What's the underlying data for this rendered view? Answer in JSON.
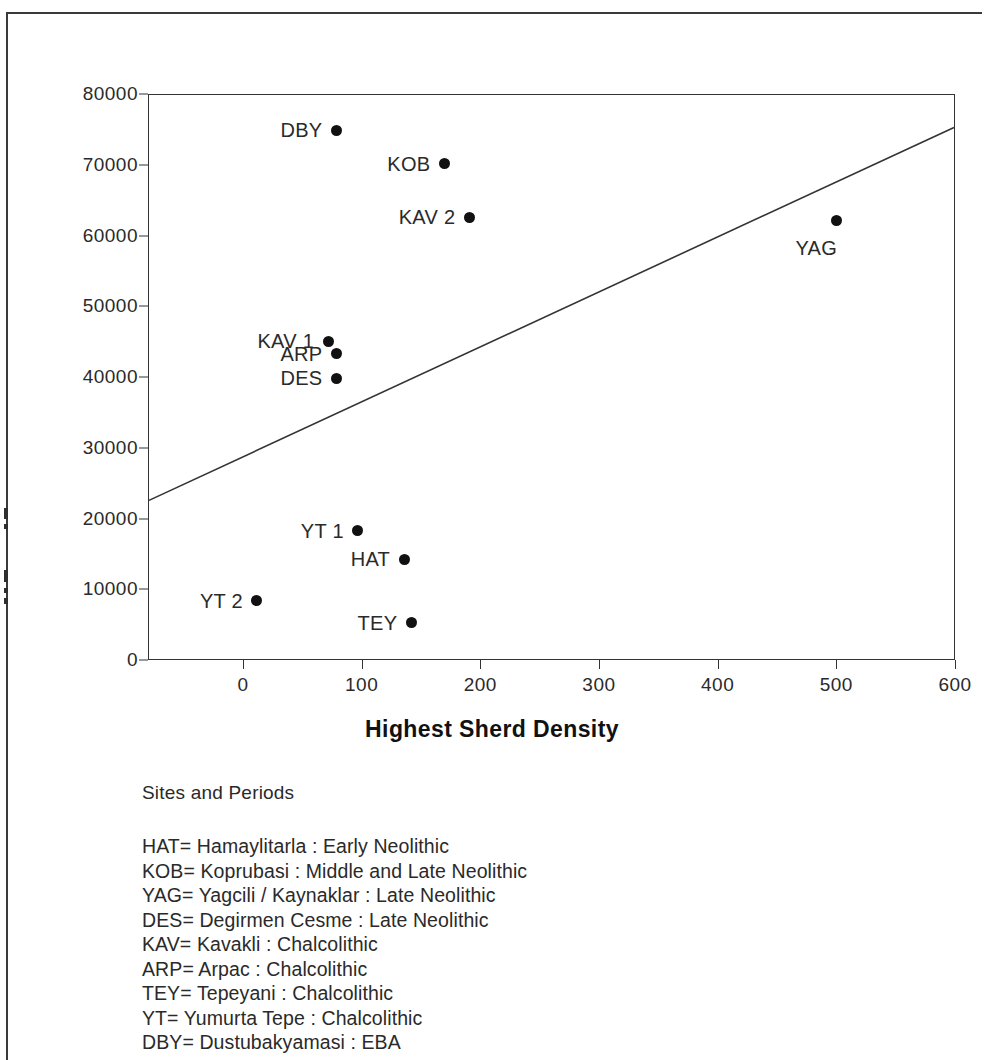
{
  "chart_data": {
    "type": "scatter",
    "title": "",
    "xlabel": "Highest Sherd Density",
    "ylabel": "",
    "xlim": [
      -80,
      600
    ],
    "ylim": [
      0,
      80000
    ],
    "grid": false,
    "legend_position": "below-plot",
    "x_ticks": [
      0,
      100,
      200,
      300,
      400,
      500,
      600
    ],
    "x_tick_labels": [
      "0",
      "100",
      "200",
      "300",
      "400",
      "500",
      "600"
    ],
    "y_ticks": [
      0,
      10000,
      20000,
      30000,
      40000,
      50000,
      60000,
      70000,
      80000
    ],
    "y_tick_labels": [
      "0",
      "10000",
      "20000",
      "30000",
      "40000",
      "50000",
      "60000",
      "70000",
      "80000"
    ],
    "points": [
      {
        "label": "DBY",
        "x": 78,
        "y": 75000,
        "label_side": "left"
      },
      {
        "label": "KOB",
        "x": 169,
        "y": 70250,
        "label_side": "left"
      },
      {
        "label": "KAV 2",
        "x": 190,
        "y": 62750,
        "label_side": "left"
      },
      {
        "label": "YAG",
        "x": 499,
        "y": 62250,
        "label_side": "below-left"
      },
      {
        "label": "KAV 1",
        "x": 71,
        "y": 45200,
        "label_side": "left"
      },
      {
        "label": "ARP",
        "x": 78,
        "y": 43400,
        "label_side": "left"
      },
      {
        "label": "DES",
        "x": 78,
        "y": 40000,
        "label_side": "left"
      },
      {
        "label": "YT 1",
        "x": 96,
        "y": 18400,
        "label_side": "left"
      },
      {
        "label": "HAT",
        "x": 135,
        "y": 14400,
        "label_side": "left"
      },
      {
        "label": "YT 2",
        "x": 11,
        "y": 8500,
        "label_side": "left"
      },
      {
        "label": "TEY",
        "x": 141,
        "y": 5400,
        "label_side": "left"
      }
    ],
    "trendline": {
      "type": "linear",
      "x_start": -80,
      "y_start": 22500,
      "x_end": 600,
      "y_end": 75400
    }
  },
  "axis": {
    "x_title": "Highest Sherd Density"
  },
  "legend": {
    "title": "Sites and Periods",
    "entries": [
      "HAT= Hamaylitarla : Early Neolithic",
      "KOB= Koprubasi : Middle and Late Neolithic",
      "YAG= Yagcili / Kaynaklar : Late Neolithic",
      "DES= Degirmen Cesme : Late Neolithic",
      "KAV= Kavakli : Chalcolithic",
      "ARP= Arpac  : Chalcolithic",
      "TEY= Tepeyani : Chalcolithic",
      "YT= Yumurta Tepe : Chalcolithic",
      "DBY= Dustubakyamasi : EBA"
    ]
  }
}
